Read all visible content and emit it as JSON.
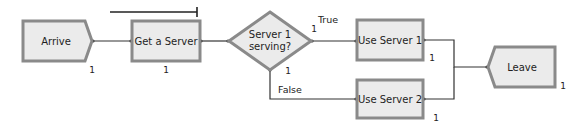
{
  "diagram": {
    "nodes": [
      {
        "id": "arrive",
        "label": "Arrive",
        "type": "create",
        "count": "1"
      },
      {
        "id": "get_server",
        "label": "Get a Server",
        "type": "process",
        "count": "1"
      },
      {
        "id": "decide",
        "label_line1": "Server 1",
        "label_line2": "serving?",
        "type": "decide",
        "true_count": "1",
        "false_count": "1"
      },
      {
        "id": "use_server_1",
        "label": "Use Server 1",
        "type": "process",
        "count": "1"
      },
      {
        "id": "use_server_2",
        "label": "Use Server 2",
        "type": "process",
        "count": "1"
      },
      {
        "id": "leave",
        "label": "Leave",
        "type": "dispose",
        "count": "1"
      }
    ],
    "branch_labels": {
      "true": "True",
      "false": "False"
    },
    "colors": {
      "node_fill": "#ebebeb",
      "node_border": "#8a8a8a",
      "connector": "#333333"
    }
  }
}
